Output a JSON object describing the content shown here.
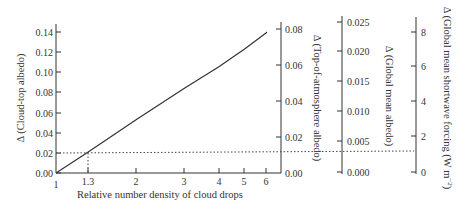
{
  "chart_data": {
    "type": "line",
    "title": "",
    "xlabel": "Relative number density of cloud drops",
    "xscale": "log",
    "xlim": [
      1,
      6.5
    ],
    "x_ticks": [
      "1",
      "1.3",
      "2",
      "3",
      "4",
      "5",
      "6"
    ],
    "ylabel": "Δ (Cloud-top albedo)",
    "ylim": [
      0,
      0.15
    ],
    "y_ticks": [
      "0.00",
      "0.02",
      "0.04",
      "0.06",
      "0.08",
      "0.10",
      "0.12",
      "0.14"
    ],
    "secondary_axes": [
      {
        "label": "Δ (Top-of-atmosphere albedo)",
        "ticks": [
          "0.00",
          "0.02",
          "0.04",
          "0.06",
          "0.08"
        ]
      },
      {
        "label": "Δ (Global mean albedo)",
        "ticks": [
          "0.000",
          "0.005",
          "0.010",
          "0.015",
          "0.020",
          "0.025"
        ]
      },
      {
        "label": "Δ (Global mean shortwave forcing (W m⁻²)",
        "ticks": [
          "0",
          "2",
          "4",
          "6",
          "8"
        ]
      }
    ],
    "series": [
      {
        "name": "Δ cloud-top albedo",
        "x": [
          1,
          1.3,
          2,
          3,
          4,
          5,
          6
        ],
        "y": [
          0.0,
          0.02,
          0.054,
          0.085,
          0.106,
          0.124,
          0.14
        ]
      }
    ],
    "annotations": [
      {
        "type": "dotted-reference",
        "x": 1.3,
        "y": 0.02,
        "extends_to": "right axes",
        "toa_albedo": 0.012,
        "global_albedo": 0.0035,
        "forcing_wm2": 1.2
      }
    ],
    "grid": false,
    "legend": null
  },
  "labels": {
    "xlabel": "Relative number density of cloud drops",
    "ylabel_left": "Δ (Cloud-top albedo)",
    "ylabel_toa": "Δ (Top-of-atmosphere albedo)",
    "ylabel_global": "Δ (Global mean albedo)",
    "ylabel_forcing": "Δ (Global mean shortwave forcing (W m",
    "ylabel_forcing_sup": "−2",
    "ylabel_forcing_end": ")"
  },
  "ticks": {
    "x": [
      {
        "label": "1",
        "px": 56
      },
      {
        "label": "1.3",
        "px": 88
      },
      {
        "label": "2",
        "px": 136
      },
      {
        "label": "3",
        "px": 184
      },
      {
        "label": "4",
        "px": 219
      },
      {
        "label": "5",
        "px": 244
      },
      {
        "label": "6",
        "px": 266
      }
    ],
    "left": [
      {
        "label": "0.00",
        "py": 173
      },
      {
        "label": "0.02",
        "py": 153
      },
      {
        "label": "0.04",
        "py": 133
      },
      {
        "label": "0.06",
        "py": 113
      },
      {
        "label": "0.08",
        "py": 92
      },
      {
        "label": "0.10",
        "py": 72
      },
      {
        "label": "0.12",
        "py": 52
      },
      {
        "label": "0.14",
        "py": 32
      }
    ],
    "toa": [
      {
        "label": "0.00",
        "py": 173
      },
      {
        "label": "0.02",
        "py": 137
      },
      {
        "label": "0.04",
        "py": 101
      },
      {
        "label": "0.06",
        "py": 65
      },
      {
        "label": "0.08",
        "py": 29
      }
    ],
    "global": [
      {
        "label": "0.000",
        "py": 172
      },
      {
        "label": "0.005",
        "py": 141
      },
      {
        "label": "0.010",
        "py": 111
      },
      {
        "label": "0.015",
        "py": 81
      },
      {
        "label": "0.020",
        "py": 51
      },
      {
        "label": "0.025",
        "py": 22
      }
    ],
    "forcing": [
      {
        "label": "0",
        "py": 172
      },
      {
        "label": "2",
        "py": 136
      },
      {
        "label": "4",
        "py": 101
      },
      {
        "label": "6",
        "py": 66
      },
      {
        "label": "8",
        "py": 32
      }
    ]
  },
  "colors": {
    "axis": "#333333",
    "line": "#333333",
    "text": "#333333"
  }
}
